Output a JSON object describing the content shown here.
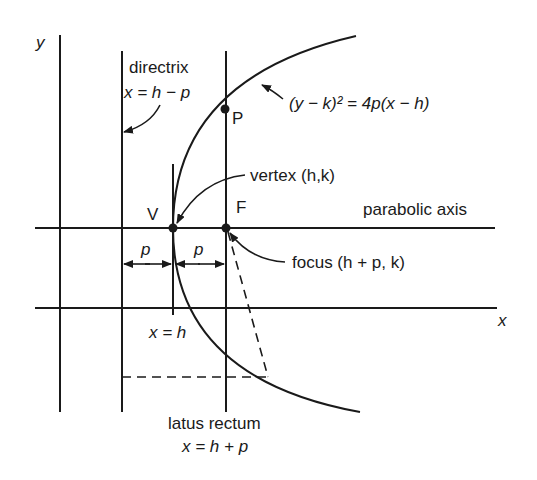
{
  "diagram": {
    "labels": {
      "y_axis": "y",
      "x_axis": "x",
      "directrix_title": "directrix",
      "directrix_eq": "x = h − p",
      "point_p": "P",
      "equation": "(y − k)² = 4p(x − h)",
      "vertex": "vertex (h,k)",
      "vertex_point": "V",
      "focus_point": "F",
      "parabolic_axis": "parabolic axis",
      "p_left": "p",
      "p_right": "p",
      "focus": "focus (h + p, k)",
      "x_eq_h": "x = h",
      "latus_title": "latus rectum",
      "latus_eq": "x = h + p"
    },
    "colors": {
      "stroke": "#1a1a1a",
      "background": "#ffffff"
    }
  }
}
